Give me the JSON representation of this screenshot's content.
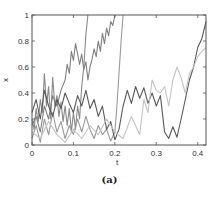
{
  "caption": "(a)",
  "chart_data": {
    "type": "line",
    "title": "",
    "xlabel": "t",
    "ylabel": "x",
    "xlim": [
      0,
      0.42
    ],
    "ylim": [
      0,
      1
    ],
    "xticks": [
      0,
      0.1,
      0.2,
      0.3,
      0.4
    ],
    "xtick_labels": [
      "0",
      "0.1",
      "0.2",
      "0.3",
      "0.4"
    ],
    "yticks": [
      0,
      0.2,
      0.4,
      0.6,
      0.8,
      1
    ],
    "ytick_labels": [
      "0",
      "0.2",
      "0.4",
      "0.6",
      "0.8",
      "1"
    ],
    "grid": false,
    "legend": null,
    "series": [
      {
        "name": "path-1",
        "color": "#8a8a8a",
        "x": [
          0,
          0.005,
          0.01,
          0.015,
          0.02,
          0.025,
          0.03,
          0.035,
          0.04,
          0.045,
          0.05,
          0.055,
          0.06,
          0.065,
          0.07,
          0.075,
          0.08,
          0.085,
          0.09,
          0.095,
          0.1,
          0.105,
          0.11,
          0.115,
          0.12,
          0.125,
          0.13,
          0.135
        ],
        "values": [
          0.2,
          0.12,
          0.28,
          0.18,
          0.35,
          0.25,
          0.55,
          0.3,
          0.45,
          0.2,
          0.52,
          0.3,
          0.38,
          0.22,
          0.33,
          0.18,
          0.3,
          0.15,
          0.28,
          0.1,
          0.25,
          0.12,
          0.3,
          0.2,
          0.45,
          0.6,
          0.85,
          1.0
        ]
      },
      {
        "name": "path-2",
        "color": "#808080",
        "x": [
          0,
          0.01,
          0.02,
          0.03,
          0.04,
          0.05,
          0.06,
          0.07,
          0.08,
          0.085,
          0.09,
          0.095,
          0.1,
          0.105,
          0.11,
          0.115,
          0.12,
          0.125,
          0.13,
          0.135,
          0.14,
          0.145,
          0.15,
          0.155,
          0.16,
          0.165,
          0.17,
          0.175,
          0.18,
          0.185,
          0.19,
          0.195,
          0.2
        ],
        "values": [
          0.15,
          0.22,
          0.1,
          0.3,
          0.2,
          0.38,
          0.3,
          0.42,
          0.5,
          0.62,
          0.55,
          0.72,
          0.65,
          0.78,
          0.7,
          0.62,
          0.7,
          0.58,
          0.64,
          0.5,
          0.6,
          0.66,
          0.74,
          0.68,
          0.8,
          0.72,
          0.86,
          0.78,
          0.9,
          0.84,
          0.95,
          0.92,
          1.0
        ]
      },
      {
        "name": "path-3",
        "color": "#9a9a9a",
        "x": [
          0,
          0.01,
          0.02,
          0.03,
          0.04,
          0.05,
          0.06,
          0.07,
          0.08,
          0.09,
          0.1,
          0.11,
          0.12,
          0.13,
          0.14,
          0.15,
          0.16,
          0.17,
          0.18,
          0.19,
          0.2,
          0.205,
          0.21,
          0.215,
          0.22
        ],
        "values": [
          0.05,
          0.15,
          0.02,
          0.2,
          0.08,
          0.25,
          0.1,
          0.18,
          0.05,
          0.15,
          0.08,
          0.2,
          0.1,
          0.22,
          0.12,
          0.05,
          0.15,
          0.08,
          0.12,
          0.03,
          0.1,
          0.3,
          0.55,
          0.8,
          1.0
        ]
      },
      {
        "name": "path-4",
        "color": "#5a5a5a",
        "x": [
          0,
          0.01,
          0.02,
          0.03,
          0.04,
          0.05,
          0.06,
          0.07,
          0.08,
          0.09,
          0.1,
          0.11,
          0.12,
          0.13,
          0.14,
          0.15,
          0.16,
          0.17,
          0.18,
          0.19,
          0.2,
          0.21,
          0.22,
          0.23,
          0.24,
          0.25,
          0.26,
          0.27,
          0.28,
          0.29,
          0.3,
          0.31,
          0.32,
          0.33,
          0.34,
          0.35,
          0.36,
          0.37,
          0.38,
          0.39,
          0.4,
          0.41,
          0.42
        ],
        "values": [
          0.25,
          0.35,
          0.2,
          0.42,
          0.3,
          0.22,
          0.35,
          0.28,
          0.4,
          0.32,
          0.25,
          0.38,
          0.3,
          0.42,
          0.28,
          0.35,
          0.22,
          0.3,
          0.12,
          0.18,
          0.04,
          0.12,
          0.3,
          0.42,
          0.32,
          0.45,
          0.36,
          0.44,
          0.32,
          0.4,
          0.3,
          0.38,
          0.1,
          0.05,
          0.14,
          0.06,
          0.2,
          0.35,
          0.5,
          0.6,
          0.75,
          0.82,
          0.95
        ]
      },
      {
        "name": "path-5",
        "color": "#c4c4c4",
        "x": [
          0,
          0.02,
          0.04,
          0.06,
          0.08,
          0.1,
          0.12,
          0.14,
          0.16,
          0.18,
          0.2,
          0.22,
          0.24,
          0.26,
          0.27,
          0.28,
          0.29,
          0.3,
          0.31,
          0.32,
          0.33,
          0.34,
          0.35,
          0.36,
          0.37,
          0.38,
          0.39,
          0.4,
          0.41,
          0.42
        ],
        "values": [
          0.1,
          0.05,
          0.18,
          0.08,
          0.02,
          0.12,
          0.05,
          0.15,
          0.08,
          0.2,
          0.1,
          0.05,
          0.22,
          0.08,
          0.35,
          0.25,
          0.5,
          0.42,
          0.4,
          0.45,
          0.3,
          0.5,
          0.6,
          0.52,
          0.4,
          0.55,
          0.6,
          0.68,
          0.72,
          0.75
        ]
      }
    ]
  }
}
